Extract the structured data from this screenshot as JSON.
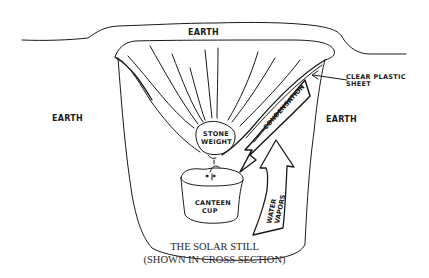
{
  "diagram": {
    "title": "THE SOLAR STILL",
    "subtitle": "(SHOWN IN CROSS SECTION)",
    "labels": {
      "earth_top": "EARTH",
      "earth_left": "EARTH",
      "earth_right": "EARTH",
      "plastic_line1": "CLEAR PLASTIC",
      "plastic_line2": "SHEET",
      "stone_line1": "STONE",
      "stone_line2": "WEIGHT",
      "condensation": "CONDENSATION",
      "water_line1": "WATER",
      "water_line2": "VAPORS",
      "cup_line1": "CANTEEN",
      "cup_line2": "CUP"
    },
    "colors": {
      "ink": "#1a1a1a",
      "background": "#ffffff",
      "caption": "#2a2a2a"
    }
  }
}
